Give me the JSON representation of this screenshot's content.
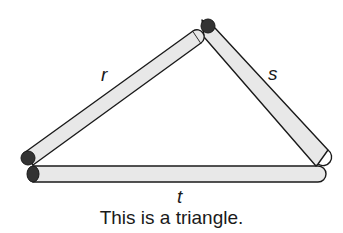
{
  "diagram": {
    "labels": {
      "r": "r",
      "s": "s",
      "t": "t"
    },
    "caption": "This is a triangle.",
    "colors": {
      "stick_fill": "#e8e8e8",
      "stick_outline": "#1a1a1a",
      "stick_end": "#333333"
    }
  }
}
